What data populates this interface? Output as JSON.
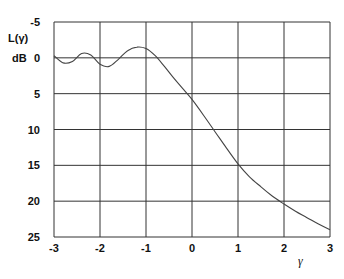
{
  "chart_data": {
    "type": "line",
    "title": "",
    "xlabel": "y",
    "ylabel": "L(y)",
    "ylabel_unit": "dB",
    "xlim": [
      -3,
      3
    ],
    "ylim": [
      25,
      -5
    ],
    "y_inverted": true,
    "grid": true,
    "legend": null,
    "x_ticks": [
      "-3",
      "-2",
      "-1",
      "0",
      "1",
      "2",
      "3"
    ],
    "y_ticks": [
      "-5",
      "0",
      "5",
      "10",
      "15",
      "20",
      "25"
    ],
    "series": [
      {
        "name": "L(y)",
        "x": [
          -3.0,
          -2.8,
          -2.6,
          -2.4,
          -2.2,
          -2.0,
          -1.8,
          -1.6,
          -1.4,
          -1.2,
          -1.0,
          -0.8,
          -0.6,
          -0.4,
          -0.2,
          0.0,
          0.25,
          0.5,
          0.75,
          1.0,
          1.25,
          1.5,
          1.75,
          2.0,
          2.25,
          2.5,
          2.75,
          3.0
        ],
        "values": [
          -0.3,
          0.7,
          0.5,
          -0.6,
          -0.4,
          0.9,
          1.2,
          0.2,
          -1.0,
          -1.5,
          -1.3,
          -0.3,
          1.2,
          2.8,
          4.3,
          5.8,
          8.0,
          10.3,
          12.6,
          14.8,
          16.6,
          18.0,
          19.3,
          20.4,
          21.4,
          22.3,
          23.2,
          24.0
        ]
      }
    ]
  },
  "axis": {
    "ylabel": "L(γ)",
    "yunit": "dB",
    "xlabel": "γ"
  }
}
